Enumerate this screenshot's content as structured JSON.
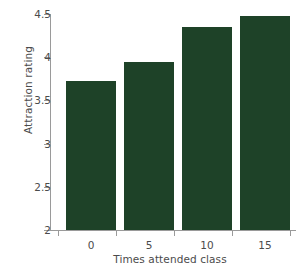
{
  "chart_data": {
    "type": "bar",
    "title": "",
    "categories": [
      "0",
      "5",
      "10",
      "15"
    ],
    "values": [
      3.72,
      3.94,
      4.35,
      4.48
    ],
    "series": [
      {
        "name": "Attraction rating",
        "values": [
          3.72,
          3.94,
          4.35,
          4.48
        ]
      }
    ],
    "xlabel": "Times attended class",
    "ylabel": "Attraction rating",
    "ylim": [
      2,
      4.5
    ],
    "yticks": [
      "2",
      "2.5",
      "3",
      "3.5",
      "4",
      "4.5"
    ],
    "ytick_values": [
      2,
      2.5,
      3,
      3.5,
      4,
      4.5
    ],
    "xticks": [
      "0",
      "5",
      "10",
      "15"
    ],
    "grid": false,
    "legend": false,
    "bar_color": "#1e4228",
    "axis_color": "#9a9a9a",
    "text_color": "#4b4b4b",
    "background": "#ffffff"
  }
}
